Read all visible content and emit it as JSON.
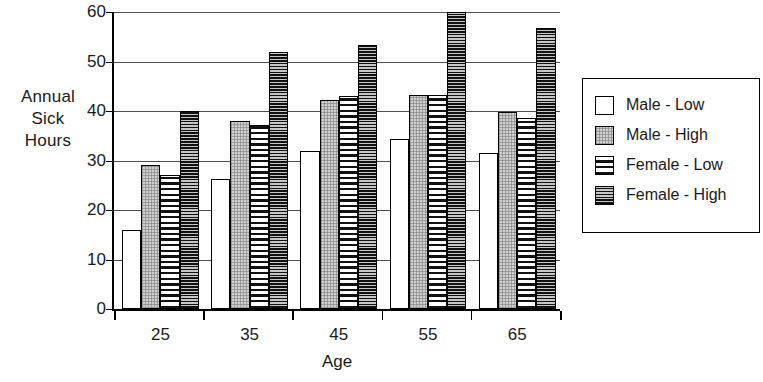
{
  "chart_data": {
    "type": "bar",
    "title": "",
    "xlabel": "Age",
    "ylabel": "Annual Sick Hours",
    "ylabel_lines": [
      "Annual",
      "Sick",
      "Hours"
    ],
    "categories": [
      "25",
      "35",
      "45",
      "55",
      "65"
    ],
    "yticks": [
      "60",
      "50",
      "40",
      "30",
      "20",
      "10",
      "0"
    ],
    "ylim": [
      0,
      60
    ],
    "grid": "horizontal",
    "legend_position": "right",
    "series": [
      {
        "name": "Male - Low",
        "pattern": "white",
        "values": [
          16,
          26.3,
          32,
          34.4,
          31.6
        ]
      },
      {
        "name": "Male - High",
        "pattern": "light-gray-dotted",
        "values": [
          29,
          38,
          42.2,
          43.3,
          39.8
        ]
      },
      {
        "name": "Female - Low",
        "pattern": "horizontal-stripes",
        "values": [
          27,
          37.1,
          43,
          43.2,
          38.5
        ]
      },
      {
        "name": "Female - High",
        "pattern": "dark-dotted",
        "values": [
          40,
          52,
          53.4,
          60,
          56.7
        ]
      }
    ]
  },
  "legend": {
    "items": [
      {
        "label": "Male - Low",
        "swatch": "swatch-white"
      },
      {
        "label": "Male - High",
        "swatch": "swatch-light-gray"
      },
      {
        "label": "Female - Low",
        "swatch": "swatch-striped"
      },
      {
        "label": "Female - High",
        "swatch": "swatch-dark"
      }
    ]
  },
  "colors": {
    "axis": "#000000",
    "grid": "#4d4d4d",
    "text": "#1a1a1a",
    "series_white": "#ffffff",
    "series_light_gray": "#cfcfcf",
    "series_striped": "#ffffff",
    "series_dark": "#3a3a3a",
    "background": "#ffffff"
  }
}
